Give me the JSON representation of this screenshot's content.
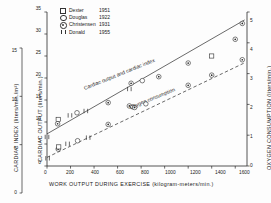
{
  "chart_data": {
    "type": "scatter",
    "title": "",
    "xlabel": "WORK OUTPUT DURING EXERCISE  (kilogram-meters/min.)",
    "xlim": [
      0,
      1700
    ],
    "xticks": [
      0,
      200,
      400,
      600,
      800,
      1000,
      1200,
      1400,
      1600
    ],
    "xticklabels": [
      "0",
      "200",
      "400",
      "600",
      "800",
      "1000",
      "1200",
      "1400",
      "1600"
    ],
    "grid": false,
    "legend_position": "upper-left-inside",
    "axes": [
      {
        "id": "cardiac-index",
        "side": "left-outer",
        "label": "CARDIAC  INDEX  (liters/min./m²)",
        "lim": [
          0,
          15
        ],
        "ticks": [
          0,
          5,
          10,
          15
        ],
        "ticklabels": [
          "0",
          "5",
          "10",
          "15"
        ]
      },
      {
        "id": "cardiac-output",
        "side": "left-inner",
        "label": "CARDIAC  OUTPUT  (liters/min.)",
        "lim": [
          0,
          35
        ],
        "ticks": [
          0,
          5,
          10,
          15,
          20,
          25,
          30,
          35
        ],
        "ticklabels": [
          "0",
          "5",
          "10",
          "15",
          "20",
          "25",
          "30",
          "35"
        ]
      },
      {
        "id": "oxygen-consumption",
        "side": "right",
        "label": "OXYGEN  CONSUMPTION   (liters/min.)",
        "lim": [
          0,
          5
        ],
        "ticks": [
          0,
          1,
          2,
          3,
          4,
          5
        ],
        "ticklabels": [
          "0",
          "1",
          "2",
          "3",
          "4",
          "5"
        ]
      }
    ],
    "annotations": [
      {
        "text": "Cardiac output and cardiac index",
        "x": 620,
        "y_axis": "cardiac-output",
        "y": 20.5,
        "rotation": -22
      },
      {
        "text": "Oxygen consumption",
        "x": 900,
        "y_axis": "cardiac-output",
        "y": 15.0,
        "rotation": -22
      }
    ],
    "series": [
      {
        "name": "Cardiac output and cardiac index",
        "axis": "cardiac-output",
        "linestyle": "solid",
        "fit_line": {
          "x": [
            0,
            1680
          ],
          "y": [
            7.3,
            33.2
          ]
        },
        "points": [
          {
            "x": 0,
            "y": 6.6,
            "marker": "bar"
          },
          {
            "x": 90,
            "y": 9.6,
            "marker": "circle-dot"
          },
          {
            "x": 95,
            "y": 10.6,
            "marker": "square"
          },
          {
            "x": 195,
            "y": 11.5,
            "marker": "bar"
          },
          {
            "x": 255,
            "y": 12.1,
            "marker": "circle"
          },
          {
            "x": 330,
            "y": 12.5,
            "marker": "bar"
          },
          {
            "x": 520,
            "y": 14.4,
            "marker": "circle-dot"
          },
          {
            "x": 700,
            "y": 17.5,
            "marker": "bar"
          },
          {
            "x": 715,
            "y": 18.8,
            "marker": "circle-dot"
          },
          {
            "x": 810,
            "y": 19.4,
            "marker": "circle"
          },
          {
            "x": 950,
            "y": 20.3,
            "marker": "circle-dot"
          },
          {
            "x": 1200,
            "y": 23.4,
            "marker": "circle-dot"
          },
          {
            "x": 1400,
            "y": 25.0,
            "marker": "square"
          },
          {
            "x": 1600,
            "y": 28.8,
            "marker": "circle-dot"
          },
          {
            "x": 1660,
            "y": 32.4,
            "marker": "circle-dot"
          }
        ]
      },
      {
        "name": "Oxygen consumption",
        "axis": "oxygen-consumption",
        "linestyle": "dashed",
        "fit_line": {
          "x": [
            0,
            1680
          ],
          "y": [
            0.28,
            3.35
          ]
        },
        "points": [
          {
            "x": 5,
            "y": 0.25,
            "marker": "bar"
          },
          {
            "x": 95,
            "y": 0.55,
            "marker": "circle-dot"
          },
          {
            "x": 100,
            "y": 0.62,
            "marker": "square"
          },
          {
            "x": 175,
            "y": 0.72,
            "marker": "bar"
          },
          {
            "x": 260,
            "y": 0.82,
            "marker": "circle"
          },
          {
            "x": 350,
            "y": 0.92,
            "marker": "bar"
          },
          {
            "x": 520,
            "y": 1.35,
            "marker": "circle-dot"
          },
          {
            "x": 700,
            "y": 1.95,
            "marker": "circle-dot"
          },
          {
            "x": 730,
            "y": 1.92,
            "marker": "circle"
          },
          {
            "x": 745,
            "y": 1.9,
            "marker": "circle-dot"
          },
          {
            "x": 840,
            "y": 2.02,
            "marker": "circle"
          },
          {
            "x": 1200,
            "y": 2.62,
            "marker": "circle-dot"
          },
          {
            "x": 1400,
            "y": 2.95,
            "marker": "circle-dot"
          },
          {
            "x": 1660,
            "y": 3.45,
            "marker": "circle-dot"
          }
        ]
      }
    ],
    "legend": [
      {
        "symbol": "square",
        "name": "Dexter",
        "year": "1951"
      },
      {
        "symbol": "circle",
        "name": "Douglas",
        "year": "1922"
      },
      {
        "symbol": "circle-dot",
        "name": "Christensen",
        "year": "1931"
      },
      {
        "symbol": "bar",
        "name": "Donald",
        "year": "1955"
      }
    ]
  }
}
